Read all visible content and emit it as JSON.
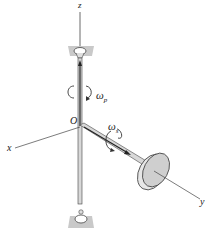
{
  "diagram": {
    "type": "gyroscope precession diagram",
    "axes": {
      "z": "z",
      "x": "x",
      "y": "y"
    },
    "origin_label": "O",
    "precession": {
      "symbol": "ω",
      "subscript": "p"
    },
    "spin": {
      "symbol": "ω",
      "subscript": "s"
    },
    "colors": {
      "line": "#333333",
      "plate": "#c8c8c8",
      "disk_face": "#d0d0d0",
      "disk_rim": "#e8e8e8"
    }
  }
}
